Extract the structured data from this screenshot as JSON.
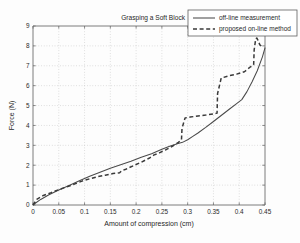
{
  "chart_data": {
    "type": "line",
    "title": "Grasping a Soft Block",
    "xlabel": "Amount of compression (cm)",
    "ylabel": "Force (N)",
    "xlim": [
      0,
      0.45
    ],
    "ylim": [
      0,
      9
    ],
    "grid": true,
    "legend_position": "top-right",
    "xticks": [
      0,
      0.05,
      0.1,
      0.15,
      0.2,
      0.25,
      0.3,
      0.35,
      0.4,
      0.45
    ],
    "xticklabels": [
      "0",
      "0.05",
      "0.1",
      "0.15",
      "0.2",
      "0.25",
      "0.3",
      "0.35",
      "0.4",
      "0.45"
    ],
    "yticks": [
      0,
      1,
      2,
      3,
      4,
      5,
      6,
      7,
      8,
      9
    ],
    "yticklabels": [
      "0",
      "1",
      "2",
      "3",
      "4",
      "5",
      "6",
      "7",
      "8",
      "9"
    ],
    "series": [
      {
        "name": "off-line measurement",
        "style": "solid",
        "color": "#4a4a4a",
        "x": [
          0.0,
          0.005,
          0.015,
          0.03,
          0.05,
          0.07,
          0.09,
          0.11,
          0.13,
          0.15,
          0.17,
          0.19,
          0.21,
          0.23,
          0.25,
          0.265,
          0.28,
          0.29,
          0.3,
          0.31,
          0.32,
          0.335,
          0.35,
          0.365,
          0.38,
          0.395,
          0.405,
          0.415,
          0.425,
          0.435,
          0.445,
          0.45
        ],
        "y": [
          0.0,
          0.1,
          0.28,
          0.5,
          0.75,
          0.98,
          1.22,
          1.45,
          1.65,
          1.85,
          2.02,
          2.2,
          2.4,
          2.58,
          2.8,
          2.95,
          3.08,
          3.15,
          3.28,
          3.45,
          3.62,
          3.9,
          4.2,
          4.5,
          4.8,
          5.1,
          5.3,
          5.7,
          6.2,
          6.75,
          7.45,
          7.9
        ]
      },
      {
        "name": "proposed on-line method",
        "style": "dashed",
        "color": "#3a3a3a",
        "x": [
          0.0,
          0.008,
          0.02,
          0.035,
          0.055,
          0.075,
          0.095,
          0.11,
          0.125,
          0.14,
          0.155,
          0.168,
          0.172,
          0.18,
          0.195,
          0.21,
          0.225,
          0.235,
          0.245,
          0.258,
          0.27,
          0.282,
          0.288,
          0.289,
          0.295,
          0.305,
          0.32,
          0.335,
          0.35,
          0.357,
          0.358,
          0.365,
          0.38,
          0.395,
          0.41,
          0.422,
          0.428,
          0.429,
          0.432,
          0.434,
          0.436,
          0.44,
          0.445
        ],
        "y": [
          0.0,
          0.3,
          0.48,
          0.62,
          0.82,
          1.0,
          1.2,
          1.32,
          1.42,
          1.5,
          1.58,
          1.62,
          1.72,
          1.8,
          1.98,
          2.15,
          2.35,
          2.52,
          2.62,
          2.78,
          2.95,
          3.15,
          3.28,
          3.85,
          4.38,
          4.42,
          4.48,
          4.52,
          4.58,
          4.62,
          5.6,
          6.38,
          6.5,
          6.58,
          6.7,
          6.95,
          7.05,
          7.8,
          8.35,
          8.4,
          8.3,
          8.05,
          7.95
        ]
      }
    ]
  },
  "legend": {
    "entries": [
      {
        "label": "off-line measurement",
        "style": "solid"
      },
      {
        "label": "proposed on-line method",
        "style": "dashed"
      }
    ]
  }
}
